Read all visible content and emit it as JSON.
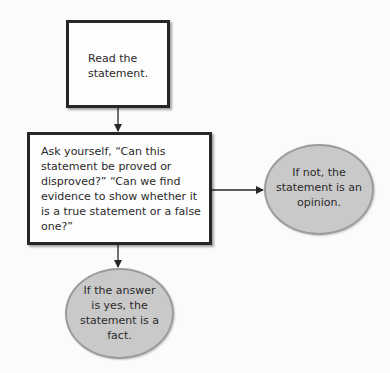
{
  "diagram": {
    "type": "flowchart",
    "colors": {
      "box_border": "#262626",
      "box_fill": "#fdfdfd",
      "ellipse_fill": "#c9c9c9",
      "ellipse_border": "#9c9c9c",
      "arrow": "#262626"
    },
    "nodes": [
      {
        "id": "read",
        "shape": "rectangle",
        "text": "Read the statement."
      },
      {
        "id": "ask",
        "shape": "rectangle",
        "text": "Ask yourself, “Can this statement be proved or disproved?” “Can we find evidence to show whether it is a true statement or a false one?”"
      },
      {
        "id": "opinion",
        "shape": "ellipse",
        "text": "If not, the statement is an opinion."
      },
      {
        "id": "fact",
        "shape": "ellipse",
        "text": "If the answer is yes, the statement is a fact."
      }
    ],
    "edges": [
      {
        "from": "read",
        "to": "ask"
      },
      {
        "from": "ask",
        "to": "opinion"
      },
      {
        "from": "ask",
        "to": "fact"
      }
    ]
  }
}
